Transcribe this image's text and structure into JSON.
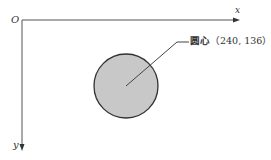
{
  "diagram": {
    "origin_label": "O",
    "x_axis_label": "x",
    "y_axis_label": "y",
    "callout": {
      "label": "圆心",
      "coords": "（240, 136）"
    },
    "colors": {
      "circle_fill": "#c8c8c8",
      "circle_stroke": "#333333",
      "axis": "#555555"
    }
  }
}
